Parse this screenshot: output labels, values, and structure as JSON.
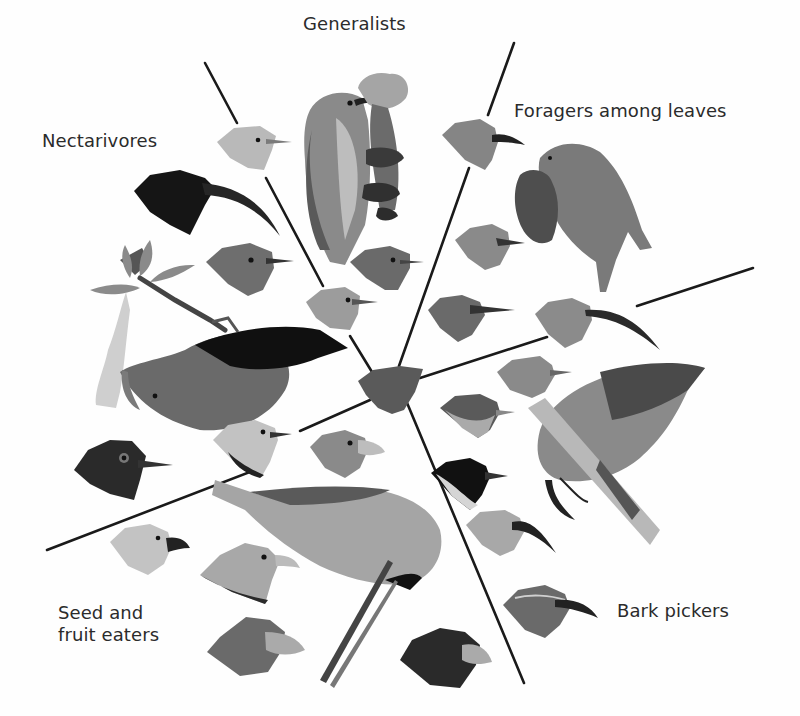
{
  "figure": {
    "palette": {
      "background": "#fefefe",
      "line": "#1a1a1a",
      "label_text": "#2b2b2b",
      "ancestor": "#5a5a5a"
    },
    "center": {
      "name": "ancestor",
      "x": 395,
      "y": 385
    },
    "sectors": [
      {
        "id": "generalists",
        "label": "Generalists",
        "x": 303,
        "y": 13
      },
      {
        "id": "foragers",
        "label": "Foragers among leaves",
        "x": 514,
        "y": 100
      },
      {
        "id": "bark",
        "label": "Bark pickers",
        "x": 617,
        "y": 600
      },
      {
        "id": "seed",
        "label": "Seed and\nfruit eaters",
        "x": 58,
        "y": 602
      },
      {
        "id": "nectar",
        "label": "Nectarivores",
        "x": 42,
        "y": 130
      }
    ]
  }
}
